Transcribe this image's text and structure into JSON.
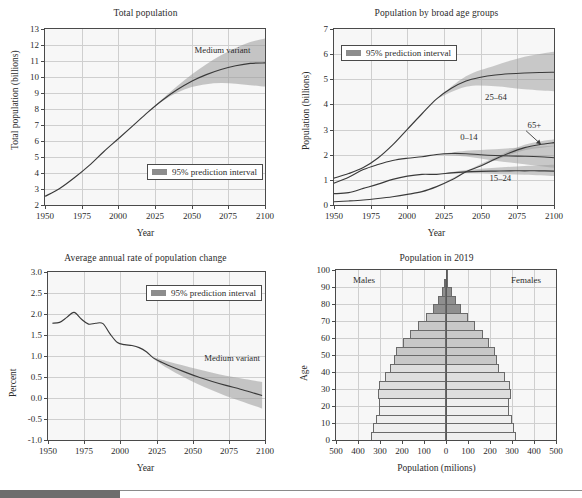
{
  "figure": {
    "footer_bar_width_px": 120
  },
  "colors": {
    "line": "#3a3a3a",
    "band": "#9a9a9a",
    "band_dark": "#7d7d7d",
    "grid": "#cfcfcf",
    "axis": "#4a4a4a",
    "plot_bg": "#f7f7f7",
    "pyramid_light": "#f0f0f0",
    "pyramid_mid": "#c8c8c8",
    "pyramid_dark": "#8f8f8f"
  },
  "chart_data": [
    {
      "id": "total-population",
      "type": "line",
      "title": "Total population",
      "xlabel": "Year",
      "ylabel": "Total population (billions)",
      "xlim": [
        1950,
        2100
      ],
      "ylim": [
        2,
        13
      ],
      "xticks": [
        1950,
        1975,
        2000,
        2025,
        2050,
        2075,
        2100
      ],
      "yticks": [
        2,
        3,
        4,
        5,
        6,
        7,
        8,
        9,
        10,
        11,
        12,
        13
      ],
      "grid": true,
      "legend": {
        "label": "95% prediction interval",
        "position": "inside-lower-right"
      },
      "annotations": [
        {
          "text": "Medium variant",
          "x": 2052,
          "y": 11.6
        }
      ],
      "series": [
        {
          "name": "Total population (medium variant)",
          "x": [
            1950,
            1960,
            1970,
            1980,
            1990,
            2000,
            2010,
            2020,
            2030,
            2040,
            2050,
            2060,
            2070,
            2080,
            2090,
            2100
          ],
          "values": [
            2.54,
            3.03,
            3.7,
            4.46,
            5.33,
            6.14,
            6.96,
            7.79,
            8.55,
            9.2,
            9.74,
            10.15,
            10.47,
            10.7,
            10.85,
            10.88
          ]
        }
      ],
      "band": {
        "name": "95% prediction interval",
        "x": [
          2020,
          2030,
          2040,
          2050,
          2060,
          2070,
          2080,
          2090,
          2100
        ],
        "lower": [
          7.79,
          8.49,
          9.01,
          9.37,
          9.55,
          9.62,
          9.58,
          9.49,
          9.4
        ],
        "upper": [
          7.79,
          8.62,
          9.42,
          10.15,
          10.8,
          11.36,
          11.82,
          12.18,
          12.4
        ]
      }
    },
    {
      "id": "population-by-age-groups",
      "type": "line",
      "title": "Population by broad age groups",
      "xlabel": "Year",
      "ylabel": "Population (billions)",
      "xlim": [
        1950,
        2100
      ],
      "ylim": [
        0,
        7
      ],
      "xticks": [
        1950,
        1975,
        2000,
        2025,
        2050,
        2075,
        2100
      ],
      "yticks": [
        0,
        1,
        2,
        3,
        4,
        5,
        6,
        7
      ],
      "grid": true,
      "legend": {
        "label": "95% prediction interval",
        "position": "inside-upper-left"
      },
      "annotations": [
        {
          "text": "25–64",
          "x": 2053,
          "y": 4.25
        },
        {
          "text": "0–14",
          "x": 2036,
          "y": 2.65
        },
        {
          "text": "15–24",
          "x": 2056,
          "y": 1.02
        },
        {
          "text": "65+",
          "x": 2082,
          "y": 3.15
        }
      ],
      "arrow": {
        "from": [
          2081,
          2.95
        ],
        "to": [
          2091,
          2.42
        ]
      },
      "series": [
        {
          "name": "25–64",
          "x": [
            1950,
            1960,
            1970,
            1980,
            1990,
            2000,
            2010,
            2020,
            2030,
            2040,
            2050,
            2060,
            2070,
            2080,
            2090,
            2100
          ],
          "values": [
            1.07,
            1.25,
            1.49,
            1.87,
            2.39,
            3.01,
            3.63,
            4.22,
            4.64,
            4.93,
            5.08,
            5.17,
            5.22,
            5.25,
            5.27,
            5.28
          ]
        },
        {
          "name": "0–14",
          "x": [
            1950,
            1960,
            1970,
            1980,
            1990,
            2000,
            2010,
            2020,
            2030,
            2040,
            2050,
            2060,
            2070,
            2080,
            2090,
            2100
          ],
          "values": [
            0.87,
            1.1,
            1.41,
            1.61,
            1.77,
            1.86,
            1.92,
            2.01,
            2.05,
            2.04,
            2.0,
            1.97,
            1.95,
            1.94,
            1.92,
            1.88
          ]
        },
        {
          "name": "15–24",
          "x": [
            1950,
            1960,
            1970,
            1980,
            1990,
            2000,
            2010,
            2020,
            2030,
            2040,
            2050,
            2060,
            2070,
            2080,
            2090,
            2100
          ],
          "values": [
            0.45,
            0.49,
            0.66,
            0.83,
            1.02,
            1.15,
            1.22,
            1.22,
            1.28,
            1.32,
            1.34,
            1.35,
            1.36,
            1.36,
            1.36,
            1.35
          ]
        },
        {
          "name": "65+",
          "x": [
            1950,
            1960,
            1970,
            1980,
            1990,
            2000,
            2010,
            2020,
            2030,
            2040,
            2050,
            2060,
            2070,
            2080,
            2090,
            2100
          ],
          "values": [
            0.13,
            0.16,
            0.2,
            0.26,
            0.33,
            0.42,
            0.53,
            0.73,
            0.99,
            1.32,
            1.55,
            1.83,
            2.08,
            2.28,
            2.4,
            2.48
          ]
        }
      ]
    },
    {
      "id": "average-annual-rate-of-change",
      "type": "line",
      "title": "Average annual rate of population change",
      "xlabel": "Year",
      "ylabel": "Percent",
      "xlim": [
        1950,
        2100
      ],
      "ylim": [
        -1.0,
        3.0
      ],
      "xticks": [
        1950,
        1975,
        2000,
        2025,
        2050,
        2075,
        2100
      ],
      "yticks": [
        "-1.0",
        "-0.5",
        "0.0",
        "0.5",
        "1.0",
        "1.5",
        "2.0",
        "2.5",
        "3.0"
      ],
      "grid": true,
      "legend": {
        "label": "95% prediction interval",
        "position": "inside-upper-right"
      },
      "annotations": [
        {
          "text": "Medium variant",
          "x": 2058,
          "y": 0.92
        }
      ],
      "series": [
        {
          "name": "Average annual rate of change (medium variant)",
          "x": [
            1953,
            1958,
            1963,
            1968,
            1973,
            1978,
            1983,
            1988,
            1993,
            1998,
            2003,
            2008,
            2013,
            2018,
            2023,
            2028,
            2033,
            2043,
            2053,
            2063,
            2073,
            2083,
            2093,
            2098
          ],
          "values": [
            1.78,
            1.8,
            1.92,
            2.04,
            1.88,
            1.76,
            1.78,
            1.77,
            1.52,
            1.32,
            1.27,
            1.25,
            1.2,
            1.1,
            0.95,
            0.86,
            0.78,
            0.64,
            0.51,
            0.4,
            0.3,
            0.21,
            0.11,
            0.06
          ]
        }
      ],
      "band": {
        "name": "95% prediction interval",
        "x": [
          2023,
          2033,
          2043,
          2053,
          2063,
          2073,
          2083,
          2093,
          2098
        ],
        "lower": [
          0.93,
          0.7,
          0.51,
          0.34,
          0.19,
          0.05,
          -0.07,
          -0.19,
          -0.25
        ],
        "upper": [
          0.97,
          0.87,
          0.78,
          0.69,
          0.61,
          0.53,
          0.47,
          0.41,
          0.38
        ]
      }
    },
    {
      "id": "population-pyramid-2019",
      "type": "bar",
      "title": "Population in 2019",
      "xlabel": "Population (milions)",
      "ylabel": "Age",
      "xlim": [
        -500,
        500
      ],
      "ylim": [
        0,
        100
      ],
      "xticks": [
        "500",
        "400",
        "300",
        "200",
        "100",
        "0",
        "100",
        "200",
        "300",
        "400",
        "500"
      ],
      "yticks": [
        0,
        10,
        20,
        30,
        40,
        50,
        60,
        70,
        80,
        90,
        100
      ],
      "grid": true,
      "side_labels": {
        "left": "Males",
        "right": "Females"
      },
      "age_groups": [
        "0–4",
        "5–9",
        "10–14",
        "15–19",
        "20–24",
        "25–29",
        "30–34",
        "35–39",
        "40–44",
        "45–49",
        "50–54",
        "55–59",
        "60–64",
        "65–69",
        "70–74",
        "75–79",
        "80–84",
        "85–89",
        "90–94",
        "95–99",
        "100+"
      ],
      "males": [
        340,
        330,
        318,
        306,
        303,
        311,
        303,
        278,
        253,
        238,
        227,
        196,
        163,
        126,
        91,
        58,
        36,
        18,
        7,
        2,
        0.3
      ],
      "females": [
        318,
        310,
        298,
        287,
        285,
        294,
        289,
        266,
        243,
        231,
        223,
        196,
        167,
        133,
        101,
        69,
        47,
        26,
        11,
        3,
        0.6
      ]
    }
  ]
}
